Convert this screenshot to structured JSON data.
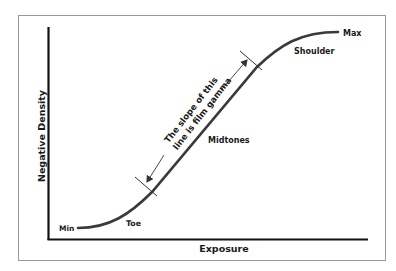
{
  "diagram": {
    "x_axis_label": "Exposure",
    "y_axis_label": "Negative Density",
    "curve_labels": {
      "min": "Min",
      "toe": "Toe",
      "midtones": "Midtones",
      "shoulder": "Shoulder",
      "max": "Max"
    },
    "annotation": {
      "line1": "The slope of this",
      "line2": "line is film gamma"
    },
    "colors": {
      "curve": "#3a3a3a",
      "axes": "#111111",
      "frame": "#9a9a9a",
      "text": "#1a1a1a"
    }
  }
}
